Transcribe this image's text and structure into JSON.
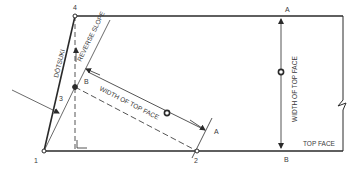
{
  "diagram": {
    "labels": {
      "point_1": "1",
      "point_2": "2",
      "point_3": "3",
      "point_4": "4",
      "dotsuki": "DŌTSUKI",
      "reverse_slope": "REVERSE SLOPE",
      "width_of_top_face_diag": "WIDTH OF TOP FACE",
      "width_of_top_face_vert": "WIDTH OF TOP FACE",
      "top_face": "TOP FACE",
      "a_top": "A",
      "b_bottom": "B",
      "a_diag": "A",
      "b_diag": "B"
    },
    "colors": {
      "line": "#2a2a2a",
      "text": "#3a3a3a",
      "background": "#ffffff"
    }
  }
}
